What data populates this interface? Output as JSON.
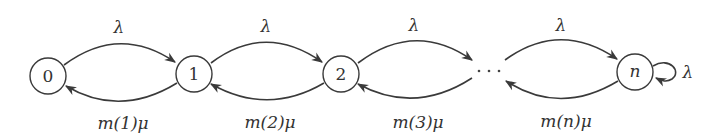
{
  "diagram": {
    "type": "birth-death-markov-chain",
    "stroke_color": "#3a3a3a",
    "text_color": "#333333",
    "nodes": [
      {
        "id": "0",
        "label": "0",
        "cx": 48,
        "cy": 76,
        "r": 18,
        "italic": false
      },
      {
        "id": "1",
        "label": "1",
        "cx": 194,
        "cy": 74,
        "r": 18,
        "italic": false
      },
      {
        "id": "2",
        "label": "2",
        "cx": 341,
        "cy": 74,
        "r": 18,
        "italic": false
      },
      {
        "id": "n",
        "label": "n",
        "cx": 635,
        "cy": 72,
        "r": 18,
        "italic": true
      }
    ],
    "ellipsis": {
      "label": "· · ·",
      "x": 489,
      "y": 70
    },
    "forward_edges": [
      {
        "from": "0",
        "to": "1",
        "label": "λ"
      },
      {
        "from": "1",
        "to": "2",
        "label": "λ"
      },
      {
        "from": "2",
        "to": "…",
        "label": "λ"
      },
      {
        "from": "…",
        "to": "n",
        "label": "λ"
      }
    ],
    "backward_edges": [
      {
        "from": "1",
        "to": "0",
        "label": "m(1)μ"
      },
      {
        "from": "2",
        "to": "1",
        "label": "m(2)μ"
      },
      {
        "from": "…",
        "to": "2",
        "label": "m(3)μ"
      },
      {
        "from": "n",
        "to": "…",
        "label": "m(n)μ"
      }
    ],
    "self_loop": {
      "node": "n",
      "label": "λ"
    }
  },
  "labels": {
    "node_0": "0",
    "node_1": "1",
    "node_2": "2",
    "node_n": "n",
    "lambda_0_1": "λ",
    "lambda_1_2": "λ",
    "lambda_2_dots": "λ",
    "lambda_dots_n": "λ",
    "lambda_self_n": "λ",
    "mu_1": "m(1)μ",
    "mu_2": "m(2)μ",
    "mu_3": "m(3)μ",
    "mu_n": "m(n)μ"
  }
}
